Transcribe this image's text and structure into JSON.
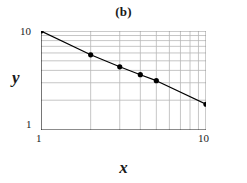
{
  "chart_data": {
    "type": "line",
    "title": "(b)",
    "xlabel": "x",
    "ylabel": "y",
    "xscale": "log",
    "yscale": "log",
    "xlim": [
      1,
      10
    ],
    "ylim": [
      1,
      10
    ],
    "grid": true,
    "grid_minor": true,
    "legend": "none",
    "x_tick_labels": [
      "1",
      "10"
    ],
    "y_tick_labels": [
      "1",
      "10"
    ],
    "x_major_ticks": [
      1,
      10
    ],
    "y_major_ticks": [
      1,
      10
    ],
    "x_minor_gridlines": [
      2,
      3,
      4,
      5,
      6,
      7,
      8,
      9
    ],
    "y_minor_gridlines": [
      2,
      3,
      4,
      5,
      6,
      7,
      8,
      9
    ],
    "series": [
      {
        "name": "data",
        "marker": "filled-circle",
        "line": "solid",
        "color": "#000000",
        "x": [
          1,
          2,
          3,
          4,
          5,
          10
        ],
        "y": [
          10,
          5.75,
          4.35,
          3.62,
          3.15,
          1.82
        ]
      }
    ],
    "fit_line": {
      "x": [
        1,
        10
      ],
      "y": [
        10,
        1.82
      ],
      "description": "straight line on log-log axes"
    }
  },
  "colors": {
    "axis": "#1a1a1a",
    "grid_major": "#8a8a8a",
    "grid_minor": "#b8b8b8",
    "data": "#000000",
    "background": "#ffffff"
  }
}
